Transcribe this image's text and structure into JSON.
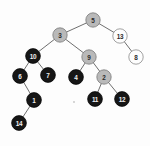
{
  "figure": {
    "name": "red-black-tree-diagram",
    "width": 150,
    "height": 146,
    "background_color": "#fdfdfd"
  },
  "palette": {
    "black_node_fill": "#161616",
    "gray_node_fill": "#b9b9b9",
    "white_node_fill": "#fdfdfd",
    "node_stroke": "#6d6d6d",
    "edge_color": "#4a4a4a",
    "label_light": "#efefef",
    "label_dark": "#2a2a2a"
  },
  "chart_data": {
    "type": "diagram",
    "title": "",
    "nodes": [
      {
        "id": "n5",
        "label": "5",
        "color": "gray",
        "x": 93,
        "y": 20,
        "r": 7.2
      },
      {
        "id": "n3",
        "label": "3",
        "color": "gray",
        "x": 60,
        "y": 35,
        "r": 7.2
      },
      {
        "id": "n13",
        "label": "13",
        "color": "white",
        "x": 120,
        "y": 36,
        "r": 7.2
      },
      {
        "id": "n8",
        "label": "8",
        "color": "white",
        "x": 136,
        "y": 57,
        "r": 7.2
      },
      {
        "id": "n10",
        "label": "10",
        "color": "black",
        "x": 33,
        "y": 56,
        "r": 7.4
      },
      {
        "id": "n9",
        "label": "9",
        "color": "gray",
        "x": 89,
        "y": 57,
        "r": 7.2
      },
      {
        "id": "n6",
        "label": "6",
        "color": "black",
        "x": 20,
        "y": 76,
        "r": 7.4
      },
      {
        "id": "n7",
        "label": "7",
        "color": "black",
        "x": 48,
        "y": 75,
        "r": 7.4
      },
      {
        "id": "n4",
        "label": "4",
        "color": "black",
        "x": 76,
        "y": 77,
        "r": 7.4
      },
      {
        "id": "n2",
        "label": "2",
        "color": "gray",
        "x": 104,
        "y": 77,
        "r": 7.2
      },
      {
        "id": "n1",
        "label": "1",
        "color": "black",
        "x": 34,
        "y": 100,
        "r": 7.4
      },
      {
        "id": "n11",
        "label": "11",
        "color": "black",
        "x": 95,
        "y": 99,
        "r": 7.4
      },
      {
        "id": "n12",
        "label": "12",
        "color": "black",
        "x": 122,
        "y": 99,
        "r": 7.4
      },
      {
        "id": "n14",
        "label": "14",
        "color": "black",
        "x": 19,
        "y": 123,
        "r": 7.4
      }
    ],
    "edges": [
      {
        "from": "n5",
        "to": "n3"
      },
      {
        "from": "n5",
        "to": "n13"
      },
      {
        "from": "n13",
        "to": "n8"
      },
      {
        "from": "n3",
        "to": "n10"
      },
      {
        "from": "n3",
        "to": "n9"
      },
      {
        "from": "n10",
        "to": "n6"
      },
      {
        "from": "n10",
        "to": "n7"
      },
      {
        "from": "n9",
        "to": "n4"
      },
      {
        "from": "n9",
        "to": "n2"
      },
      {
        "from": "n6",
        "to": "n1"
      },
      {
        "from": "n1",
        "to": "n14"
      },
      {
        "from": "n2",
        "to": "n11"
      },
      {
        "from": "n2",
        "to": "n12"
      }
    ],
    "legend": [],
    "annotations": []
  }
}
